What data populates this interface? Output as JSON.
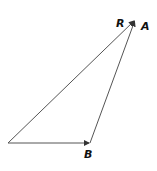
{
  "diagram": {
    "type": "vector-triangle",
    "vectors": [
      {
        "name": "B",
        "label": "B",
        "from": [
          8,
          143
        ],
        "to": [
          90,
          143
        ]
      },
      {
        "name": "A",
        "label": "A",
        "from": [
          90,
          143
        ],
        "to": [
          135,
          20
        ]
      },
      {
        "name": "R",
        "label": "R",
        "from": [
          8,
          143
        ],
        "to": [
          135,
          20
        ]
      }
    ],
    "labels": {
      "r": "R",
      "a": "A",
      "b": "B"
    },
    "colors": {
      "line": "#555555",
      "text": "#111111"
    }
  }
}
